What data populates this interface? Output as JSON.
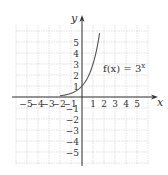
{
  "chart_data": {
    "type": "line",
    "title": "",
    "function_label": "f(x) = 3^x",
    "function_label_base": "f(x) = 3",
    "function_label_exp": "x",
    "xlabel": "x",
    "ylabel": "y",
    "xlim": [
      -6,
      6
    ],
    "ylim": [
      -6,
      6
    ],
    "grid": true,
    "x_ticks": [
      "-5",
      "-4",
      "-3",
      "-2",
      "-1",
      "1",
      "2",
      "3",
      "4",
      "5"
    ],
    "y_ticks": [
      "5",
      "4",
      "3",
      "2",
      "1",
      "-1",
      "-2",
      "-3",
      "-4",
      "-5"
    ],
    "series": [
      {
        "name": "f(x) = 3^x",
        "x": [
          -2,
          -1.5,
          -1,
          -0.5,
          0,
          0.5,
          1,
          1.25,
          1.5,
          1.6
        ],
        "y": [
          0.11,
          0.19,
          0.33,
          0.58,
          1,
          1.73,
          3,
          3.95,
          5.2,
          5.8
        ]
      }
    ]
  }
}
